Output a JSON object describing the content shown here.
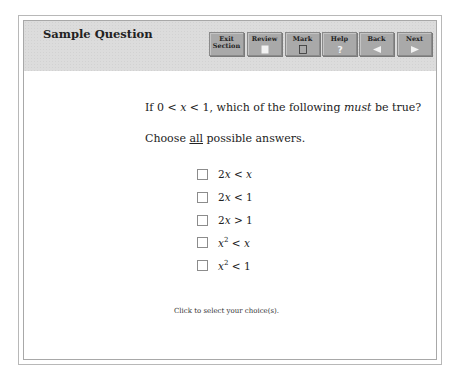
{
  "header": {
    "title": "Sample Question",
    "buttons": [
      {
        "id": "exit-section",
        "line1": "Exit",
        "line2": "Section",
        "icon": "none"
      },
      {
        "id": "review",
        "line1": "Review",
        "icon": "page-icon"
      },
      {
        "id": "mark",
        "line1": "Mark",
        "icon": "checkbox-icon"
      },
      {
        "id": "help",
        "line1": "Help",
        "icon": "question-icon"
      },
      {
        "id": "back",
        "line1": "Back",
        "icon": "left-arrow-icon"
      },
      {
        "id": "next",
        "line1": "Next",
        "icon": "right-arrow-icon"
      }
    ]
  },
  "question": {
    "stem_prefix": "If 0 < ",
    "stem_var1": "x",
    "stem_mid": " < 1, which of the following ",
    "stem_emph": "must",
    "stem_suffix": " be true?",
    "instruction_prefix": "Choose ",
    "instruction_underlined": "all",
    "instruction_suffix": " possible answers.",
    "choices": [
      {
        "a": "2",
        "v": "x",
        "op": " < ",
        "b": "x",
        "b_italic": true
      },
      {
        "a": "2",
        "v": "x",
        "op": " < ",
        "b": "1",
        "b_italic": false
      },
      {
        "a": "2",
        "v": "x",
        "op": " > ",
        "b": "1",
        "b_italic": false
      },
      {
        "a": "",
        "v": "x",
        "sup": "2",
        "op": " < ",
        "b": "x",
        "b_italic": true
      },
      {
        "a": "",
        "v": "x",
        "sup": "2",
        "op": " < ",
        "b": "1",
        "b_italic": false
      }
    ]
  },
  "footer": {
    "hint": "Click to select your choice(s)."
  }
}
